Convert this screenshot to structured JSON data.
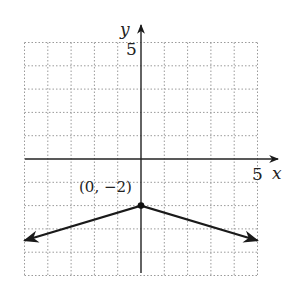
{
  "chart_data": {
    "type": "line",
    "title": "",
    "xlabel": "x",
    "ylabel": "y",
    "xlim": [
      -5,
      5
    ],
    "ylim": [
      -5,
      5
    ],
    "grid": true,
    "x_tick_labels": [
      {
        "value": 5,
        "label": "5"
      }
    ],
    "y_tick_labels": [
      {
        "value": 5,
        "label": "5"
      }
    ],
    "series": [
      {
        "name": "graph",
        "points": [
          [
            -5,
            -3.5
          ],
          [
            0,
            -2
          ],
          [
            5,
            -3.5
          ]
        ],
        "arrows_at_ends": true
      }
    ],
    "annotations": [
      {
        "point": [
          0,
          -2
        ],
        "label": "(0, −2)",
        "marker": "filled-dot"
      }
    ]
  },
  "labels": {
    "x_axis": "x",
    "y_axis": "y",
    "x_tick": "5",
    "y_tick": "5",
    "vertex": "(0, −2)"
  },
  "colors": {
    "axis": "#222222",
    "grid": "#9a9a9a",
    "line": "#1a1a1a"
  }
}
